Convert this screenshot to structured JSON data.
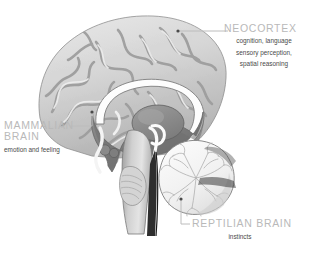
{
  "figure": {
    "background_color": "#ffffff",
    "heading_color": "#b9b9b9",
    "subtext_color": "#4a4a4a",
    "leader_line_color": "#b9b9b9"
  },
  "labels": {
    "neocortex": {
      "heading": "NEOCORTEX",
      "lines": [
        "cognition, language",
        "sensory perception,",
        "spatial reasoning"
      ],
      "description": "cognition, language sensory perception, spatial reasoning"
    },
    "mammalian": {
      "heading_line1": "MAMMALIAN",
      "heading_line2": "BRAIN",
      "heading": "MAMMALIAN BRAIN",
      "description": "emotion and feeling"
    },
    "reptilian": {
      "heading": "REPTILIAN BRAIN",
      "description": "instincts"
    }
  },
  "anatomy": {
    "cerebral_cortex": "cerebral-cortex",
    "corpus_callosum": "corpus-callosum",
    "thalamus": "thalamus",
    "limbic_region": "limbic-region",
    "brainstem": "brainstem",
    "cerebellum": "cerebellum",
    "spinal_cord": "spinal-cord"
  }
}
